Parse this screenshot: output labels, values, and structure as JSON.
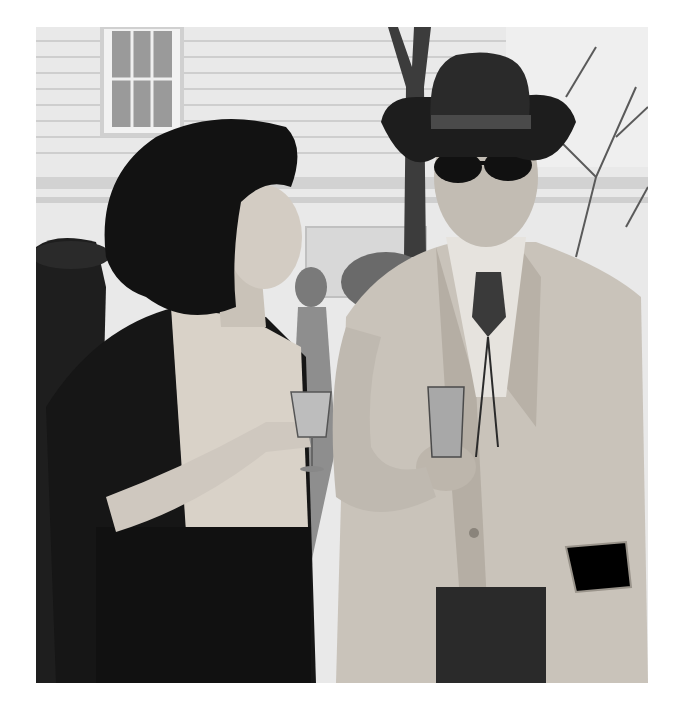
{
  "image": {
    "type": "photograph",
    "color_mode": "grayscale",
    "alt": "Black-and-white photo of a dark-haired woman holding a drink talking to a man in a cowboy hat, sunglasses and light western-style jacket holding a glass, in front of a white clapboard house and trees",
    "frame": {
      "x": 36,
      "y": 27,
      "width": 612,
      "height": 656
    },
    "background_color": "#ffffff"
  },
  "caption": ""
}
